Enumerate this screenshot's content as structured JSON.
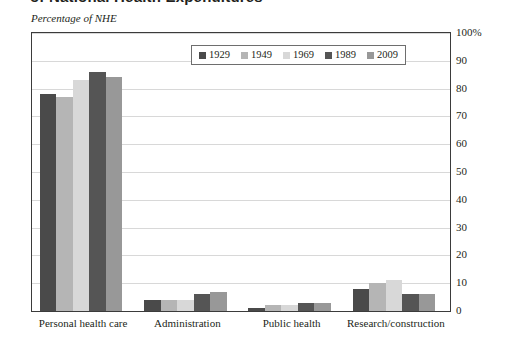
{
  "page": {
    "cut_title": "of National Health Expenditures",
    "axis_caption": "Percentage of NHE"
  },
  "chart_data": {
    "type": "bar",
    "title": "",
    "subtitle": "Percentage of NHE",
    "xlabel": "",
    "ylabel": "Percentage of NHE",
    "ylim": [
      0,
      100
    ],
    "yticks": [
      0,
      10,
      20,
      30,
      40,
      50,
      60,
      70,
      80,
      90,
      100
    ],
    "ytick_labels": [
      "0",
      "10",
      "20",
      "30",
      "40",
      "50",
      "60",
      "70",
      "80",
      "90",
      "100%"
    ],
    "grid": true,
    "legend_position": "top-center",
    "categories": [
      "Personal health care",
      "Administration",
      "Public health",
      "Research/construction"
    ],
    "series": [
      {
        "name": "1929",
        "color": "#4a4a4a",
        "values": [
          78,
          4,
          1,
          8
        ]
      },
      {
        "name": "1949",
        "color": "#b5b5b5",
        "values": [
          77,
          4,
          2,
          10
        ]
      },
      {
        "name": "1969",
        "color": "#d8d8d8",
        "values": [
          83,
          4,
          2,
          11
        ]
      },
      {
        "name": "1989",
        "color": "#555555",
        "values": [
          86,
          6,
          3,
          6
        ]
      },
      {
        "name": "2009",
        "color": "#989898",
        "values": [
          84,
          7,
          3,
          6
        ]
      }
    ]
  },
  "legend": {
    "items": [
      {
        "label": "1929"
      },
      {
        "label": "1949"
      },
      {
        "label": "1969"
      },
      {
        "label": "1989"
      },
      {
        "label": "2009"
      }
    ]
  }
}
